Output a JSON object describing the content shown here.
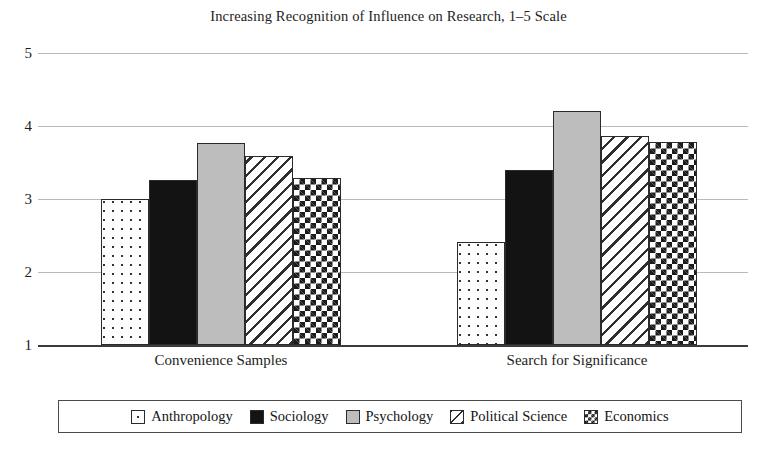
{
  "chart_data": {
    "type": "bar",
    "title": "Increasing Recognition of Influence on Research, 1–5 Scale",
    "xlabel": "",
    "ylabel": "",
    "ylim": [
      1,
      5
    ],
    "yticks": [
      "1",
      "2",
      "3",
      "4",
      "5"
    ],
    "grid": true,
    "legend_position": "bottom",
    "categories": [
      "Convenience Samples",
      "Search for Significance"
    ],
    "series": [
      {
        "name": "Anthropology",
        "pattern": "dotted",
        "values": [
          3.0,
          2.41
        ]
      },
      {
        "name": "Sociology",
        "pattern": "solid-black",
        "values": [
          3.26,
          3.4
        ]
      },
      {
        "name": "Psychology",
        "pattern": "light-gray",
        "values": [
          3.77,
          4.2
        ]
      },
      {
        "name": "Political Science",
        "pattern": "diagonal-hatch",
        "values": [
          3.59,
          3.87
        ]
      },
      {
        "name": "Economics",
        "pattern": "checkerboard",
        "values": [
          3.29,
          3.78
        ]
      }
    ]
  },
  "colors": {
    "gridline": "#b9b9b9",
    "axis": "#3b3b3b",
    "bar_outline": "#2b2b2b",
    "solid_black": "#131313",
    "light_gray": "#bdbdbd",
    "text": "#1d1d1d",
    "background": "#ffffff"
  }
}
